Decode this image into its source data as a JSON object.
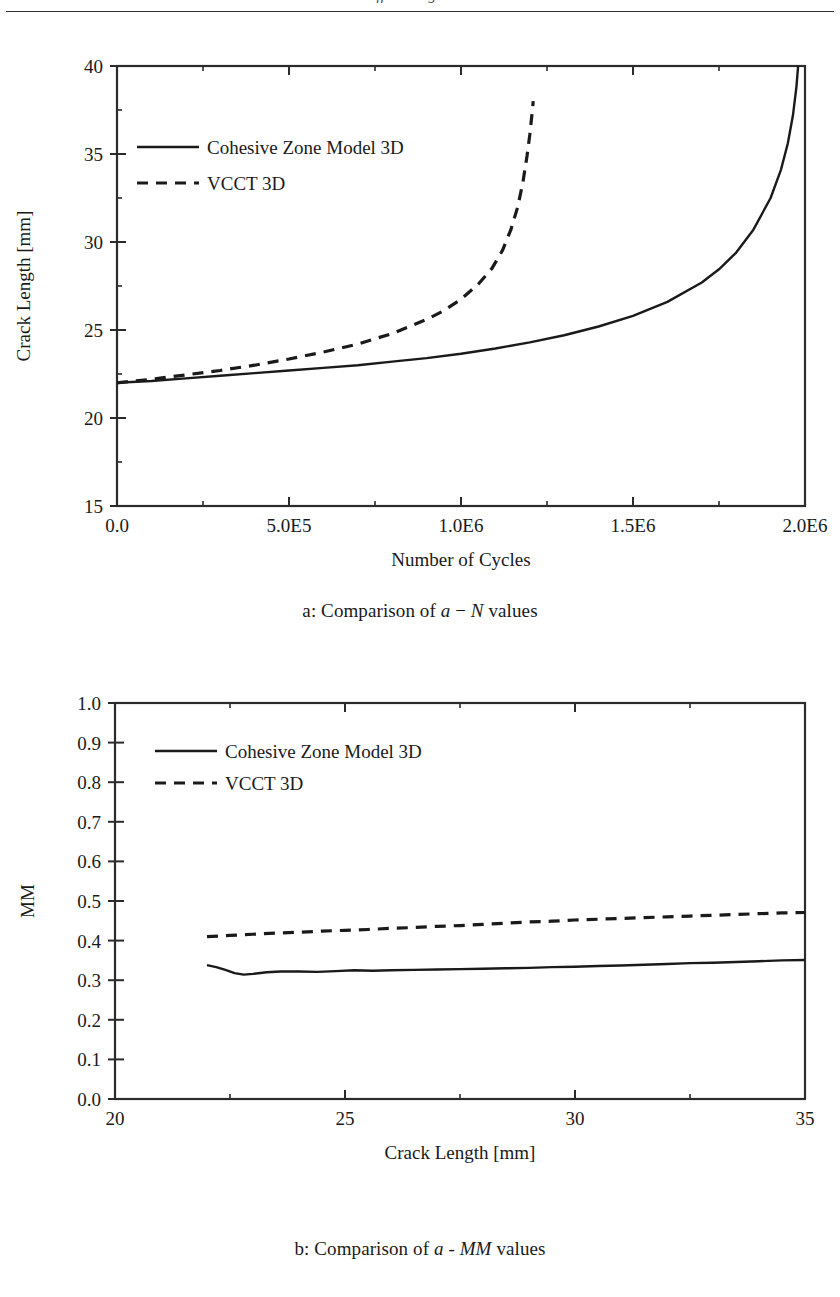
{
  "header": {
    "running_text": "cut-off running head text"
  },
  "colors": {
    "ink": "#1a1a1a",
    "axis": "#2b2b2b",
    "background": "#ffffff"
  },
  "figures": [
    {
      "id": "a",
      "subcaption_prefix": "a: Comparison of ",
      "subcaption_var1": "a",
      "subcaption_op": " − ",
      "subcaption_var2": "N",
      "subcaption_suffix": " values",
      "chart_data": {
        "type": "line",
        "title": "",
        "xlabel": "Number of Cycles",
        "ylabel": "Crack Length [mm]",
        "xlim": [
          0,
          2000000
        ],
        "ylim": [
          15,
          40
        ],
        "xticks": [
          0,
          500000,
          1000000,
          1500000,
          2000000
        ],
        "xtick_labels": [
          "0.0",
          "5.0E5",
          "1.0E6",
          "1.5E6",
          "2.0E6"
        ],
        "xminor_ticks": [
          250000,
          750000,
          1250000,
          1750000
        ],
        "yticks": [
          15,
          20,
          25,
          30,
          35,
          40
        ],
        "ytick_labels": [
          "15",
          "20",
          "25",
          "30",
          "35",
          "40"
        ],
        "yminor_ticks": [
          17.5,
          22.5,
          27.5,
          32.5,
          37.5
        ],
        "grid": false,
        "legend_position": "upper-left",
        "series": [
          {
            "name": "Cohesive Zone Model 3D",
            "style": "solid",
            "x": [
              0,
              100000,
              200000,
              300000,
              400000,
              500000,
              600000,
              700000,
              800000,
              900000,
              1000000,
              1100000,
              1200000,
              1300000,
              1400000,
              1500000,
              1600000,
              1700000,
              1750000,
              1800000,
              1850000,
              1900000,
              1930000,
              1950000,
              1965000,
              1975000,
              1980000
            ],
            "y": [
              22.0,
              22.1,
              22.25,
              22.4,
              22.55,
              22.7,
              22.85,
              23.0,
              23.2,
              23.4,
              23.65,
              23.95,
              24.3,
              24.7,
              25.2,
              25.8,
              26.6,
              27.7,
              28.45,
              29.4,
              30.7,
              32.5,
              34.1,
              35.6,
              37.2,
              38.8,
              40.0
            ]
          },
          {
            "name": "VCCT 3D",
            "style": "dashed",
            "x": [
              0,
              50000,
              100000,
              200000,
              300000,
              400000,
              500000,
              600000,
              700000,
              800000,
              900000,
              950000,
              1000000,
              1050000,
              1090000,
              1120000,
              1145000,
              1165000,
              1180000,
              1192000,
              1200000,
              1206000,
              1210000
            ],
            "y": [
              22.0,
              22.1,
              22.2,
              22.45,
              22.7,
              23.0,
              23.35,
              23.75,
              24.2,
              24.8,
              25.6,
              26.1,
              26.75,
              27.6,
              28.5,
              29.5,
              30.7,
              32.0,
              33.4,
              34.9,
              36.1,
              37.2,
              38.0
            ]
          }
        ]
      }
    },
    {
      "id": "b",
      "subcaption_prefix": "b: Comparison of ",
      "subcaption_var1": "a",
      "subcaption_op": " - ",
      "subcaption_var2": "MM",
      "subcaption_suffix": " values",
      "chart_data": {
        "type": "line",
        "title": "",
        "xlabel": "Crack Length [mm]",
        "ylabel": "MM",
        "xlim": [
          20,
          35
        ],
        "ylim": [
          0.0,
          1.0
        ],
        "xticks": [
          20,
          25,
          30,
          35
        ],
        "xtick_labels": [
          "20",
          "25",
          "30",
          "35"
        ],
        "xminor_ticks": [
          22.5,
          27.5,
          32.5
        ],
        "yticks": [
          0.0,
          0.1,
          0.2,
          0.3,
          0.4,
          0.5,
          0.6,
          0.7,
          0.8,
          0.9,
          1.0
        ],
        "ytick_labels": [
          "0.0",
          "0.1",
          "0.2",
          "0.3",
          "0.4",
          "0.5",
          "0.6",
          "0.7",
          "0.8",
          "0.9",
          "1.0"
        ],
        "grid": false,
        "legend_position": "upper-center",
        "series": [
          {
            "name": "Cohesive Zone Model 3D",
            "style": "solid",
            "x": [
              22.0,
              22.2,
              22.4,
              22.6,
              22.8,
              23.0,
              23.3,
              23.6,
              24.0,
              24.4,
              24.8,
              25.2,
              25.6,
              26.0,
              26.5,
              27.0,
              27.5,
              28.0,
              28.5,
              29.0,
              29.5,
              30.0,
              30.5,
              31.0,
              31.5,
              32.0,
              32.5,
              33.0,
              33.5,
              34.0,
              34.5,
              35.0
            ],
            "y": [
              0.338,
              0.333,
              0.326,
              0.318,
              0.314,
              0.316,
              0.32,
              0.322,
              0.322,
              0.321,
              0.323,
              0.325,
              0.324,
              0.325,
              0.326,
              0.327,
              0.328,
              0.329,
              0.33,
              0.331,
              0.333,
              0.334,
              0.336,
              0.337,
              0.339,
              0.341,
              0.343,
              0.344,
              0.346,
              0.348,
              0.35,
              0.351
            ]
          },
          {
            "name": "VCCT 3D",
            "style": "dashed",
            "x": [
              22.0,
              22.5,
              23.0,
              23.5,
              24.0,
              24.5,
              25.0,
              25.5,
              26.0,
              26.5,
              27.0,
              27.5,
              28.0,
              28.5,
              29.0,
              29.5,
              30.0,
              30.5,
              31.0,
              31.5,
              32.0,
              32.5,
              33.0,
              33.5,
              34.0,
              34.5,
              35.0
            ],
            "y": [
              0.41,
              0.413,
              0.416,
              0.419,
              0.421,
              0.424,
              0.426,
              0.428,
              0.431,
              0.433,
              0.436,
              0.438,
              0.441,
              0.444,
              0.447,
              0.449,
              0.452,
              0.454,
              0.456,
              0.458,
              0.46,
              0.462,
              0.464,
              0.466,
              0.468,
              0.47,
              0.471
            ]
          }
        ]
      }
    }
  ]
}
